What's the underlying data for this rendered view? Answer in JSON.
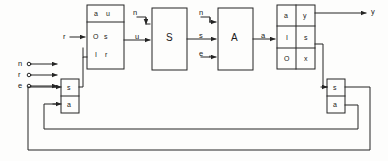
{
  "diagram": {
    "stroke_color": "#242424",
    "background_color": "#fdfdfc",
    "text_color": "#1a1a1a"
  },
  "inputs": {
    "terminals": [
      {
        "label": "n",
        "x": 18,
        "y": 62
      },
      {
        "label": "r",
        "x": 18,
        "y": 73
      },
      {
        "label": "e",
        "x": 18,
        "y": 84
      }
    ],
    "reference": {
      "label": "r",
      "x": 64,
      "y": 35
    },
    "s_input": {
      "label": "n",
      "x": 135,
      "y": 12
    }
  },
  "outputs": {
    "primary": {
      "label": "y",
      "x": 372,
      "y": 12
    }
  },
  "blocks": {
    "observer": {
      "name": "observer-block",
      "x": 87,
      "y": 5,
      "width": 37,
      "height": 64,
      "header_height": 17,
      "header_cells": [
        "a",
        "u"
      ],
      "body_rows": [
        [
          "O",
          "s"
        ],
        [
          "I",
          "r"
        ]
      ]
    },
    "s_block": {
      "name": "s-block",
      "label": "S",
      "x": 152,
      "y": 8,
      "width": 35,
      "height": 62
    },
    "a_block": {
      "name": "a-block",
      "label": "A",
      "x": 218,
      "y": 8,
      "width": 35,
      "height": 62
    },
    "io_block": {
      "name": "io-block",
      "x": 277,
      "y": 5,
      "width": 38,
      "height": 64,
      "grid": [
        [
          "a",
          "y"
        ],
        [
          "I",
          "s"
        ],
        [
          "O",
          "x"
        ]
      ]
    },
    "left_selector": {
      "name": "left-selector-block",
      "x": 61,
      "y": 79,
      "width": 18,
      "height": 34,
      "rows": [
        "s",
        "a"
      ]
    },
    "right_selector": {
      "name": "right-selector-block",
      "x": 327,
      "y": 79,
      "width": 18,
      "height": 34,
      "rows": [
        "s",
        "a"
      ]
    }
  },
  "signals": {
    "u": {
      "label": "u",
      "x": 136,
      "y": 35
    },
    "s_to_a": {
      "label": "s",
      "x": 200,
      "y": 35
    },
    "n_to_a": {
      "label": "n",
      "x": 200,
      "y": 12
    },
    "e_to_a": {
      "label": "e",
      "x": 200,
      "y": 54
    },
    "a_out": {
      "label": "a",
      "x": 262,
      "y": 35
    }
  }
}
